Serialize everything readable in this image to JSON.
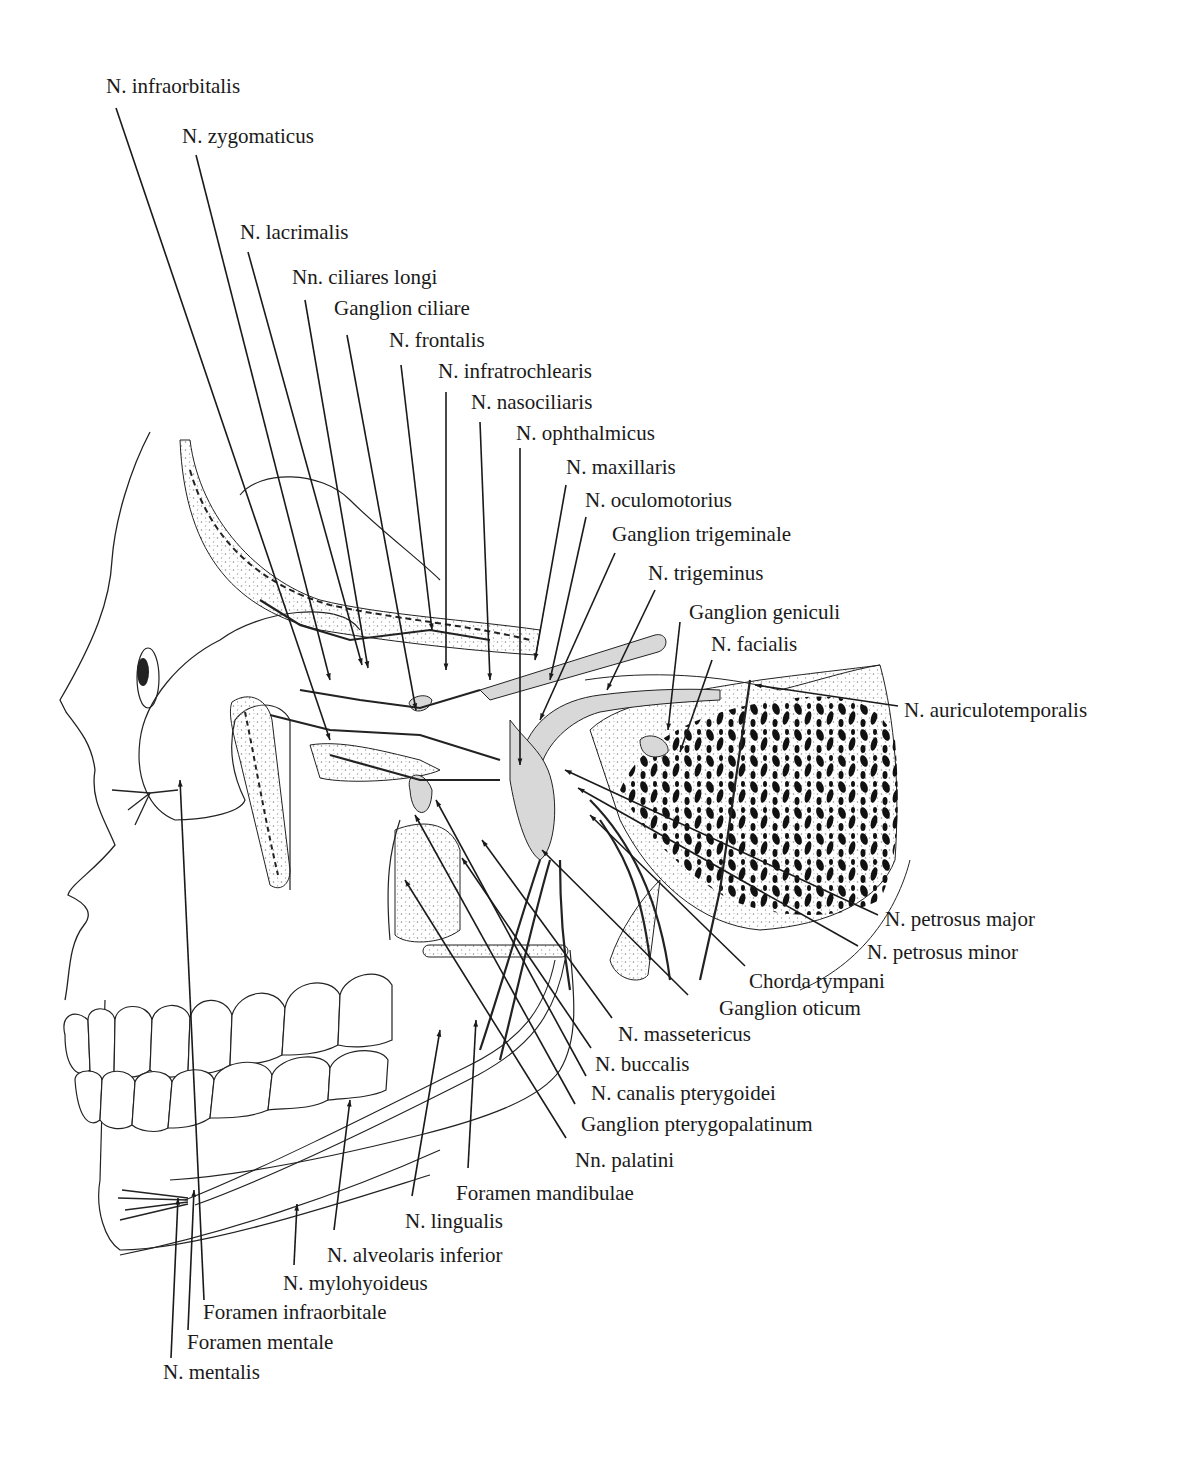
{
  "figure": {
    "type": "anatomical illustration"
  },
  "labels": [
    {
      "id": "n-infraorbitalis",
      "text": "N. infraorbitalis",
      "x": 106,
      "y": 76
    },
    {
      "id": "n-zygomaticus",
      "text": "N. zygomaticus",
      "x": 182,
      "y": 126
    },
    {
      "id": "n-lacrimalis",
      "text": "N. lacrimalis",
      "x": 240,
      "y": 222
    },
    {
      "id": "nn-ciliares-longi",
      "text": "Nn. ciliares longi",
      "x": 292,
      "y": 267
    },
    {
      "id": "ganglion-ciliare",
      "text": "Ganglion ciliare",
      "x": 334,
      "y": 298
    },
    {
      "id": "n-frontalis",
      "text": "N. frontalis",
      "x": 389,
      "y": 330
    },
    {
      "id": "n-infratrochlearis",
      "text": "N. infratrochlearis",
      "x": 438,
      "y": 361
    },
    {
      "id": "n-nasociliaris",
      "text": "N. nasociliaris",
      "x": 471,
      "y": 392
    },
    {
      "id": "n-ophthalmicus",
      "text": "N. ophthalmicus",
      "x": 516,
      "y": 423
    },
    {
      "id": "n-maxillaris",
      "text": "N. maxillaris",
      "x": 566,
      "y": 457
    },
    {
      "id": "n-oculomotorius",
      "text": "N. oculomotorius",
      "x": 585,
      "y": 490
    },
    {
      "id": "ganglion-trigeminale",
      "text": "Ganglion trigeminale",
      "x": 612,
      "y": 524
    },
    {
      "id": "n-trigeminus",
      "text": "N. trigeminus",
      "x": 648,
      "y": 563
    },
    {
      "id": "ganglion-geniculi",
      "text": "Ganglion geniculi",
      "x": 689,
      "y": 602
    },
    {
      "id": "n-facialis",
      "text": "N. facialis",
      "x": 711,
      "y": 634
    },
    {
      "id": "n-auriculotemporalis",
      "text": "N. auriculotemporalis",
      "x": 904,
      "y": 700
    },
    {
      "id": "n-petrosus-major",
      "text": "N. petrosus major",
      "x": 885,
      "y": 909
    },
    {
      "id": "n-petrosus-minor",
      "text": "N. petrosus minor",
      "x": 867,
      "y": 942
    },
    {
      "id": "chorda-tympani",
      "text": "Chorda tympani",
      "x": 749,
      "y": 971
    },
    {
      "id": "ganglion-oticum",
      "text": "Ganglion oticum",
      "x": 719,
      "y": 998
    },
    {
      "id": "n-massetericus",
      "text": "N. massetericus",
      "x": 618,
      "y": 1024
    },
    {
      "id": "n-buccalis",
      "text": "N. buccalis",
      "x": 595,
      "y": 1054
    },
    {
      "id": "n-canalis-pterygoidei",
      "text": "N. canalis pterygoidei",
      "x": 591,
      "y": 1083
    },
    {
      "id": "ganglion-pterygopalatinum",
      "text": "Ganglion pterygopalatinum",
      "x": 581,
      "y": 1114
    },
    {
      "id": "nn-palatini",
      "text": "Nn. palatini",
      "x": 575,
      "y": 1150
    },
    {
      "id": "foramen-mandibulae",
      "text": "Foramen mandibulae",
      "x": 456,
      "y": 1183
    },
    {
      "id": "n-lingualis",
      "text": "N. lingualis",
      "x": 405,
      "y": 1211
    },
    {
      "id": "n-alveolaris-inferior",
      "text": "N. alveolaris inferior",
      "x": 327,
      "y": 1245
    },
    {
      "id": "n-mylohyoideus",
      "text": "N. mylohyoideus",
      "x": 283,
      "y": 1273
    },
    {
      "id": "foramen-infraorbitale",
      "text": "Foramen infraorbitale",
      "x": 203,
      "y": 1302
    },
    {
      "id": "foramen-mentale",
      "text": "Foramen mentale",
      "x": 187,
      "y": 1332
    },
    {
      "id": "n-mentalis",
      "text": "N. mentalis",
      "x": 163,
      "y": 1362
    }
  ],
  "leaders": [
    {
      "id": "n-infraorbitalis",
      "x1": 116,
      "y1": 108,
      "x2": 330,
      "y2": 740
    },
    {
      "id": "n-zygomaticus",
      "x1": 196,
      "y1": 155,
      "x2": 330,
      "y2": 680
    },
    {
      "id": "n-lacrimalis",
      "x1": 248,
      "y1": 252,
      "x2": 362,
      "y2": 665
    },
    {
      "id": "nn-ciliares-longi",
      "x1": 305,
      "y1": 300,
      "x2": 368,
      "y2": 668
    },
    {
      "id": "ganglion-ciliare",
      "x1": 347,
      "y1": 335,
      "x2": 416,
      "y2": 710
    },
    {
      "id": "n-frontalis",
      "x1": 401,
      "y1": 365,
      "x2": 432,
      "y2": 630
    },
    {
      "id": "n-infratrochlearis",
      "x1": 446,
      "y1": 392,
      "x2": 446,
      "y2": 670
    },
    {
      "id": "n-nasociliaris",
      "x1": 480,
      "y1": 422,
      "x2": 490,
      "y2": 680
    },
    {
      "id": "n-ophthalmicus",
      "x1": 520,
      "y1": 448,
      "x2": 520,
      "y2": 765
    },
    {
      "id": "n-maxillaris",
      "x1": 566,
      "y1": 485,
      "x2": 535,
      "y2": 660
    },
    {
      "id": "n-oculomotorius",
      "x1": 586,
      "y1": 517,
      "x2": 550,
      "y2": 680
    },
    {
      "id": "ganglion-trigeminale",
      "x1": 615,
      "y1": 553,
      "x2": 540,
      "y2": 720
    },
    {
      "id": "n-trigeminus",
      "x1": 655,
      "y1": 590,
      "x2": 607,
      "y2": 690
    },
    {
      "id": "ganglion-geniculi",
      "x1": 680,
      "y1": 622,
      "x2": 668,
      "y2": 730
    },
    {
      "id": "n-facialis",
      "x1": 712,
      "y1": 660,
      "x2": 680,
      "y2": 752
    },
    {
      "id": "n-auriculotemporalis",
      "x1": 898,
      "y1": 706,
      "x2": 755,
      "y2": 685
    },
    {
      "id": "n-petrosus-major",
      "x1": 878,
      "y1": 915,
      "x2": 565,
      "y2": 770
    },
    {
      "id": "n-petrosus-minor",
      "x1": 858,
      "y1": 946,
      "x2": 578,
      "y2": 788
    },
    {
      "id": "chorda-tympani",
      "x1": 745,
      "y1": 966,
      "x2": 590,
      "y2": 815
    },
    {
      "id": "ganglion-oticum",
      "x1": 688,
      "y1": 995,
      "x2": 542,
      "y2": 850
    },
    {
      "id": "n-massetericus",
      "x1": 612,
      "y1": 1018,
      "x2": 482,
      "y2": 840
    },
    {
      "id": "n-buccalis",
      "x1": 591,
      "y1": 1048,
      "x2": 462,
      "y2": 858
    },
    {
      "id": "n-canalis-pterygoidei",
      "x1": 586,
      "y1": 1076,
      "x2": 436,
      "y2": 800
    },
    {
      "id": "ganglion-pterygopalatinum",
      "x1": 575,
      "y1": 1104,
      "x2": 415,
      "y2": 815
    },
    {
      "id": "nn-palatini",
      "x1": 566,
      "y1": 1138,
      "x2": 405,
      "y2": 880
    },
    {
      "id": "foramen-mandibulae",
      "x1": 468,
      "y1": 1168,
      "x2": 476,
      "y2": 1020
    },
    {
      "id": "n-lingualis",
      "x1": 412,
      "y1": 1196,
      "x2": 440,
      "y2": 1030
    },
    {
      "id": "n-alveolaris-inferior",
      "x1": 334,
      "y1": 1230,
      "x2": 350,
      "y2": 1100
    },
    {
      "id": "n-mylohyoideus",
      "x1": 294,
      "y1": 1265,
      "x2": 297,
      "y2": 1204
    },
    {
      "id": "foramen-infraorbitale",
      "x1": 204,
      "y1": 1300,
      "x2": 180,
      "y2": 780
    },
    {
      "id": "foramen-mentale",
      "x1": 188,
      "y1": 1330,
      "x2": 194,
      "y2": 1190
    },
    {
      "id": "n-mentalis",
      "x1": 171,
      "y1": 1358,
      "x2": 178,
      "y2": 1198
    }
  ],
  "colors": {
    "background": "#ffffff",
    "ink": "#1a1a1a",
    "nerve_fill": "#d8d8d8",
    "bone_stipple": "#999999",
    "dense_bone": "#111111"
  }
}
